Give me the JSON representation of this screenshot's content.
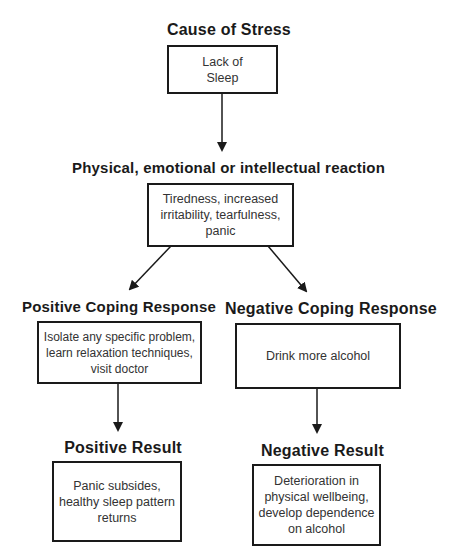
{
  "diagram": {
    "cause": {
      "heading": "Cause of Stress",
      "box_text": "Lack of\nSleep"
    },
    "reaction": {
      "heading": "Physical, emotional or intellectual reaction",
      "box_text": "Tiredness, increased\nirritability, tearfulness,\npanic"
    },
    "positive_coping": {
      "heading": "Positive Coping Response",
      "box_text": "Isolate any specific problem,\nlearn relaxation techniques,\nvisit doctor"
    },
    "negative_coping": {
      "heading": "Negative Coping Response",
      "box_text": "Drink more alcohol"
    },
    "positive_result": {
      "heading": "Positive Result",
      "box_text": "Panic subsides,\nhealthy sleep pattern\nreturns"
    },
    "negative_result": {
      "heading": "Negative Result",
      "box_text": "Deterioration in\nphysical wellbeing,\ndevelop dependence\non alcohol"
    },
    "colors": {
      "line": "#1a1a1a",
      "text": "#333333",
      "background": "#ffffff"
    }
  }
}
